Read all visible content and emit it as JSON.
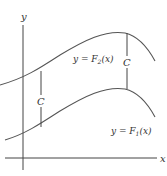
{
  "figure": {
    "axes": {
      "x_label": "x",
      "y_label": "y"
    },
    "curves": [
      {
        "name": "F2",
        "label_prefix": "y = F",
        "label_sub": "2",
        "label_suffix": "(x)",
        "color": "#555555"
      },
      {
        "name": "F1",
        "label_prefix": "y = F",
        "label_sub": "1",
        "label_suffix": "(x)",
        "color": "#555555"
      }
    ],
    "gaps": [
      {
        "label": "C"
      },
      {
        "label": "C"
      }
    ]
  }
}
